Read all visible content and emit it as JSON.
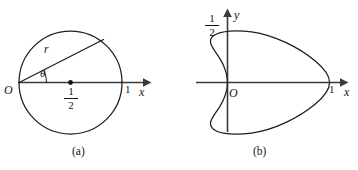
{
  "figure": {
    "background_color": "#ffffff",
    "ink_color": "#1d1d1d",
    "panels": [
      {
        "id": "a",
        "caption": "(a)",
        "description": "Circle of diameter 1 passing through the origin, with radius vector r at angle theta",
        "labels": {
          "origin": "O",
          "radius": "r",
          "angle": "θ",
          "x_axis": "x",
          "x_tick_one": "1",
          "center_fraction_numerator": "1",
          "center_fraction_denominator": "2"
        },
        "geometry": {
          "circle_center_x": 0.5,
          "circle_center_y": 0,
          "circle_radius": 0.5,
          "x_axis_from": 0,
          "x_axis_to": 1.25,
          "theta_degrees": 30,
          "marked_points": [
            {
              "label": "O",
              "x": 0,
              "y": 0
            },
            {
              "label": "1/2",
              "x": 0.5,
              "y": 0
            },
            {
              "label": "1",
              "x": 1,
              "y": 0
            }
          ]
        }
      },
      {
        "id": "b",
        "caption": "(b)",
        "description": "Cardioid with cusp at the origin, rightmost point at x = 1, maximum height 1/2",
        "labels": {
          "origin": "O",
          "x_axis": "x",
          "y_axis": "y",
          "x_tick_one": "1",
          "y_tick_fraction_numerator": "1",
          "y_tick_fraction_denominator": "2"
        },
        "geometry": {
          "curve_type": "cardioid",
          "polar_equation": "r = (1 + cos(theta)) / 2",
          "cusp": {
            "x": 0,
            "y": 0
          },
          "rightmost_point": {
            "x": 1,
            "y": 0
          },
          "max_y": 0.5,
          "min_y": -0.5,
          "leftmost_x": -0.125,
          "marked_points": [
            {
              "label": "O",
              "x": 0,
              "y": 0
            },
            {
              "label": "1",
              "x": 1,
              "y": 0
            },
            {
              "label": "1/2",
              "x": 0,
              "y": 0.5
            }
          ]
        }
      }
    ]
  }
}
